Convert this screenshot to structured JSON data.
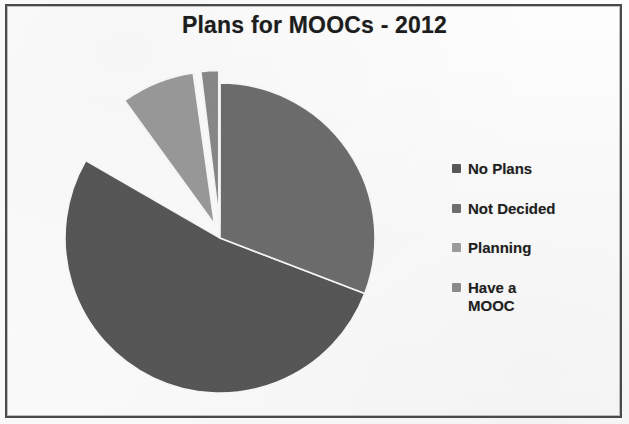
{
  "frame": {
    "border_color": "#4a4a4a",
    "background_color": "#fdfdfd"
  },
  "title": "Plans for MOOCs - 2012",
  "legend": {
    "position": "right",
    "items": [
      {
        "label": "No Plans",
        "color": "#585858",
        "swatch_icon": "square-swatch-icon"
      },
      {
        "label": "Not Decided",
        "color": "#6e6e6e",
        "swatch_icon": "square-swatch-icon"
      },
      {
        "label": "Planning",
        "color": "#9b9b9b",
        "swatch_icon": "square-swatch-icon"
      },
      {
        "label": "Have a\nMOOC",
        "color": "#8a8a8a",
        "swatch_icon": "square-swatch-icon"
      }
    ]
  },
  "chart_data": {
    "type": "pie",
    "title": "Plans for MOOCs - 2012",
    "xlabel": "",
    "ylabel": "",
    "grid": false,
    "legend_position": "right",
    "exploded_slices": [
      "Planning",
      "Have a MOOC"
    ],
    "start_angle_deg": 0,
    "direction": "clockwise",
    "categories": [
      "No Plans",
      "Not Decided",
      "Planning",
      "Have a MOOC"
    ],
    "values": [
      62,
      28,
      8,
      2
    ],
    "unit": "percent",
    "slices": [
      {
        "label": "No Plans",
        "value": 62,
        "color": "#585858",
        "exploded": false,
        "start_deg": 111,
        "end_deg": 300
      },
      {
        "label": "Not Decided",
        "value": 28,
        "color": "#6e6e6e",
        "exploded": false,
        "start_deg": 0,
        "end_deg": 111
      },
      {
        "label": "Planning",
        "value": 8,
        "color": "#9b9b9b",
        "exploded": true,
        "start_deg": 324,
        "end_deg": 352
      },
      {
        "label": "Have a MOOC",
        "value": 2,
        "color": "#8a8a8a",
        "exploded": true,
        "start_deg": 353,
        "end_deg": 360
      }
    ]
  }
}
